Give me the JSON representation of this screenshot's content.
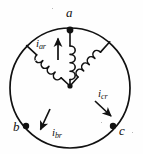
{
  "figure": {
    "type": "three-phase-wye-winding-diagram",
    "background_color": "#fefefe",
    "ink_color": "#111111",
    "stator_circle": {
      "center_x": 70,
      "center_y": 88,
      "radius": 60,
      "stroke_width": 1.7
    },
    "neutral_node": {
      "x": 70,
      "y": 86
    }
  },
  "terminals": [
    {
      "id": "a",
      "label": "a",
      "node_x": 70,
      "node_y": 30,
      "label_x": 66,
      "label_y": 12
    },
    {
      "id": "b",
      "label": "b",
      "node_x": 26,
      "node_y": 126,
      "label_x": 14,
      "label_y": 126
    },
    {
      "id": "c",
      "label": "c",
      "node_x": 113,
      "node_y": 126,
      "label_x": 119,
      "label_y": 127
    }
  ],
  "currents": [
    {
      "id": "iar",
      "base": "i",
      "subscript": "ar",
      "label_x": 37,
      "label_y": 42,
      "direction": "up",
      "arrow_from_x": 58,
      "arrow_from_y": 60,
      "arrow_to_x": 58,
      "arrow_to_y": 37
    },
    {
      "id": "ibr",
      "base": "i",
      "subscript": "br",
      "label_x": 53,
      "label_y": 130,
      "direction": "down-left",
      "arrow_from_x": 49,
      "arrow_from_y": 109,
      "arrow_to_x": 40,
      "arrow_to_y": 131
    },
    {
      "id": "icr",
      "base": "i",
      "subscript": "cr",
      "label_x": 99,
      "label_y": 93,
      "direction": "down-right",
      "arrow_from_x": 95,
      "arrow_from_y": 102,
      "arrow_to_x": 112,
      "arrow_to_y": 117
    }
  ],
  "windings": [
    {
      "id": "winding-a",
      "from": "neutral",
      "to": "a",
      "loops": 4,
      "orientation": "vertical"
    },
    {
      "id": "winding-b",
      "from": "neutral",
      "to": "b",
      "loops": 4,
      "orientation": "diagonal-down-left"
    },
    {
      "id": "winding-c",
      "from": "neutral",
      "to": "c",
      "loops": 4,
      "orientation": "diagonal-down-right"
    }
  ]
}
